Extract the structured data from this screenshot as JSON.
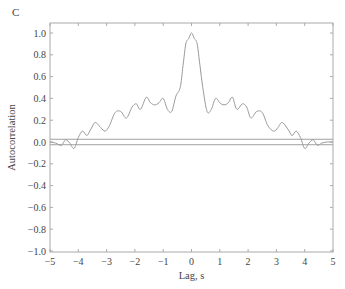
{
  "chart_data": {
    "type": "line",
    "panel_label": "C",
    "title": "",
    "xlabel": "Lag, s",
    "ylabel": "Autocorrelation",
    "xlim": [
      -5,
      5
    ],
    "ylim": [
      -1.0,
      1.0
    ],
    "xticks": [
      -5,
      -4,
      -3,
      -2,
      -1,
      0,
      1,
      2,
      3,
      4,
      5
    ],
    "xtick_labels": [
      "−5",
      "−4",
      "−3",
      "−2",
      "−1",
      "0",
      "1",
      "2",
      "3",
      "4",
      "5"
    ],
    "yticks": [
      1.0,
      0.8,
      0.6,
      0.4,
      0.2,
      0.0,
      -0.2,
      -0.4,
      -0.6,
      -0.8,
      -1.0
    ],
    "ytick_labels": [
      "1.0",
      "0.8",
      "0.6",
      "0.4",
      "0.2",
      "0.0",
      "−0.2",
      "−0.4",
      "−0.6",
      "−0.8",
      "−1.0"
    ],
    "grid": false,
    "colors": {
      "line": "#9a9a9a",
      "axis": "#aaaaaa",
      "bounds": "#888888"
    },
    "confidence_bounds": [
      0.025,
      -0.025
    ],
    "series": [
      {
        "name": "autocorrelation",
        "x": [
          -5.0,
          -4.8,
          -4.6,
          -4.45,
          -4.3,
          -4.15,
          -4.0,
          -3.85,
          -3.7,
          -3.55,
          -3.4,
          -3.2,
          -3.05,
          -2.9,
          -2.7,
          -2.5,
          -2.3,
          -2.1,
          -1.95,
          -1.8,
          -1.6,
          -1.45,
          -1.3,
          -1.15,
          -1.0,
          -0.85,
          -0.7,
          -0.55,
          -0.4,
          -0.3,
          -0.2,
          -0.1,
          0.0,
          0.1,
          0.2,
          0.3,
          0.4,
          0.55,
          0.7,
          0.85,
          1.0,
          1.15,
          1.3,
          1.45,
          1.6,
          1.8,
          1.95,
          2.1,
          2.3,
          2.5,
          2.7,
          2.9,
          3.05,
          3.2,
          3.4,
          3.55,
          3.7,
          3.85,
          4.0,
          4.15,
          4.3,
          4.45,
          4.6,
          4.8,
          5.0
        ],
        "y": [
          0.0,
          -0.01,
          -0.03,
          0.02,
          -0.01,
          -0.06,
          0.04,
          0.1,
          0.06,
          0.12,
          0.18,
          0.13,
          0.1,
          0.15,
          0.27,
          0.28,
          0.22,
          0.32,
          0.35,
          0.3,
          0.41,
          0.36,
          0.34,
          0.36,
          0.4,
          0.3,
          0.28,
          0.42,
          0.5,
          0.7,
          0.9,
          0.95,
          1.0,
          0.95,
          0.9,
          0.7,
          0.5,
          0.28,
          0.3,
          0.4,
          0.36,
          0.34,
          0.36,
          0.41,
          0.3,
          0.35,
          0.32,
          0.22,
          0.28,
          0.27,
          0.15,
          0.1,
          0.13,
          0.18,
          0.12,
          0.06,
          0.1,
          0.04,
          -0.06,
          -0.01,
          0.02,
          -0.03,
          -0.01,
          0.0,
          0.0
        ]
      }
    ]
  }
}
